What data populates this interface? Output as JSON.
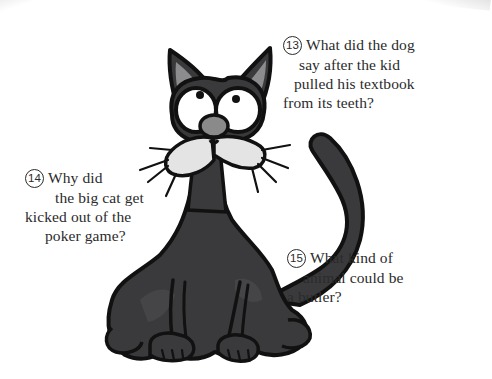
{
  "page": {
    "background": "#ffffff"
  },
  "illustration": {
    "subject": "cartoon black cat sitting",
    "colors": {
      "body": "#3a3a3c",
      "outline": "#111111",
      "ear_inner": "#8c8c8e",
      "nose": "#8a8a8a",
      "cheeks": "#e4e4e4",
      "eyes": "#ffffff",
      "pupils": "#111111"
    }
  },
  "riddles": [
    {
      "number": "13",
      "lines": [
        "What did the dog",
        "say after the kid",
        "pulled his textbook",
        "from its teeth?"
      ]
    },
    {
      "number": "14",
      "lines": [
        "Why did",
        "the big cat get",
        "kicked out of the",
        "poker game?"
      ]
    },
    {
      "number": "15",
      "lines": [
        "What kind of",
        "animal could be",
        "a butler?"
      ]
    }
  ]
}
